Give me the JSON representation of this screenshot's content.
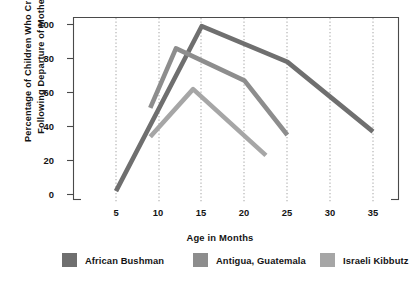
{
  "chart_data": {
    "type": "line",
    "title": "",
    "xlabel": "Age in Months",
    "ylabel": "Percentage of Children Who Cried\nFollowing Departure of Mother",
    "xlim": [
      3,
      38
    ],
    "ylim": [
      0,
      105
    ],
    "xticks": [
      5,
      10,
      15,
      20,
      25,
      30,
      35
    ],
    "xtick_labels": [
      "5",
      "10",
      "15",
      "20",
      "25",
      "30",
      "35"
    ],
    "yticks": [
      0,
      20,
      40,
      60,
      80,
      100
    ],
    "ytick_labels": [
      "0",
      "20",
      "40",
      "60",
      "80",
      "100"
    ],
    "grid": "vertical-dotted",
    "legend_position": "below",
    "series": [
      {
        "name": "African Bushman",
        "color": "#6f6f6f",
        "x": [
          5,
          15,
          25,
          35
        ],
        "values": [
          2,
          99,
          78,
          37
        ]
      },
      {
        "name": "Antigua, Guatemala",
        "color": "#8d8d8d",
        "x": [
          9,
          12,
          20,
          25
        ],
        "values": [
          51,
          86,
          67,
          35
        ]
      },
      {
        "name": "Israeli Kibbutz",
        "color": "#a6a6a6",
        "x": [
          9,
          14,
          22.5
        ],
        "values": [
          34,
          62,
          23
        ]
      }
    ]
  },
  "legend": {
    "items": [
      {
        "label": "African Bushman",
        "color": "#6f6f6f"
      },
      {
        "label": "Antigua, Guatemala",
        "color": "#8d8d8d"
      },
      {
        "label": "Israeli Kibbutz",
        "color": "#a6a6a6"
      }
    ]
  },
  "axes": {
    "x_title": "Age in Months",
    "y_title": "Percentage of Children Who Cried\nFollowing Departure of Mother",
    "x_tick_labels": [
      "5",
      "10",
      "15",
      "20",
      "25",
      "30",
      "35"
    ],
    "y_tick_labels": [
      "0",
      "20",
      "40",
      "60",
      "80",
      "100"
    ]
  },
  "colors": {
    "frame": "#4a4a4a",
    "grid": "#9a9a9a",
    "text": "#141414",
    "background": "#ffffff"
  }
}
